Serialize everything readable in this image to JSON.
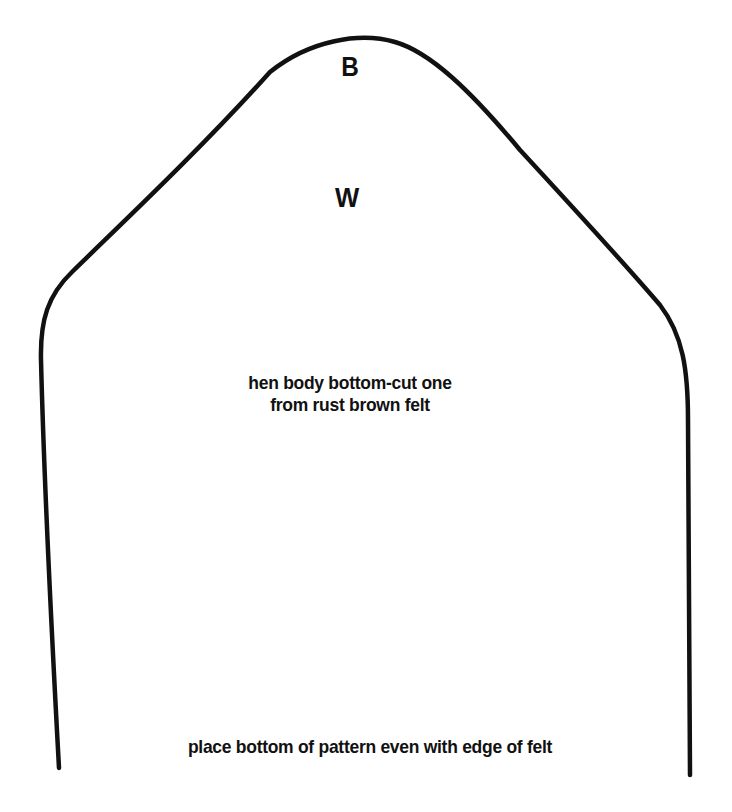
{
  "pattern": {
    "piece_name": "hen body bottom",
    "labels": {
      "top_mark": "B",
      "inner_mark": "W"
    },
    "instructions": {
      "line1": "hen body bottom-cut one",
      "line2": "from rust brown felt"
    },
    "bottom_note": "place bottom of pattern even with edge of felt",
    "outline_color": "#111111",
    "background_color": "#ffffff"
  }
}
